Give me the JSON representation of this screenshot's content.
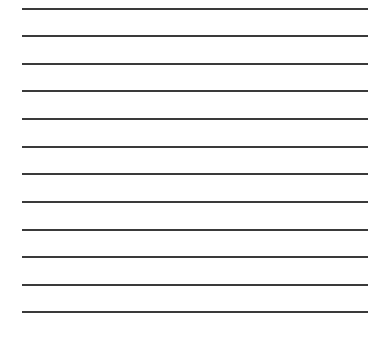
{
  "sheet": {
    "type": "lined-paper",
    "line_color": "#3a3a3a",
    "background_color": "#ffffff",
    "line_count": 12,
    "lines": [
      {
        "y": 8
      },
      {
        "y": 35
      },
      {
        "y": 63
      },
      {
        "y": 90
      },
      {
        "y": 118
      },
      {
        "y": 146
      },
      {
        "y": 173
      },
      {
        "y": 201
      },
      {
        "y": 229
      },
      {
        "y": 256
      },
      {
        "y": 284
      },
      {
        "y": 311
      }
    ]
  }
}
